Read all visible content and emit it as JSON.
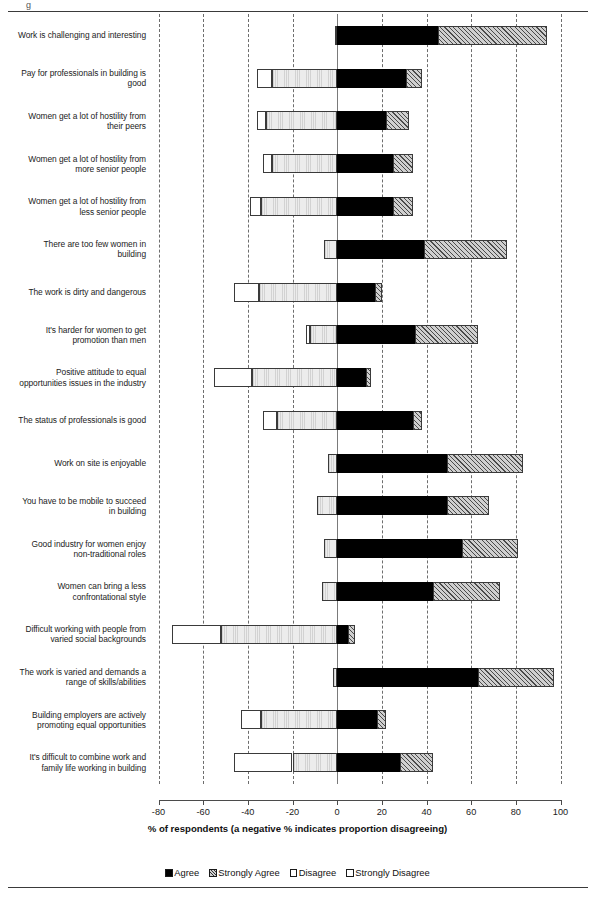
{
  "top_mark": "g",
  "chart_data": {
    "type": "bar",
    "subtype": "diverging-stacked-horizontal",
    "title": "",
    "xlabel": "% of respondents (a negative % indicates proportion disagreeing)",
    "ylabel": "",
    "xlim": [
      -80,
      100
    ],
    "xticks": [
      -80,
      -60,
      -40,
      -20,
      0,
      20,
      40,
      60,
      80,
      100
    ],
    "xticklabels": [
      "-80",
      "-60",
      "-40",
      "-20",
      "0",
      "20",
      "40",
      "60",
      "80",
      "100"
    ],
    "grid": "vertical-dashed",
    "legend_position": "bottom",
    "legend": [
      "Agree",
      "Strongly Agree",
      "Disagree",
      "Strongly Disagree"
    ],
    "series": [
      {
        "name": "Agree",
        "key": "agree",
        "fill": "solid-black"
      },
      {
        "name": "Strongly Agree",
        "key": "strongly_agree",
        "fill": "diagonal-hatch"
      },
      {
        "name": "Disagree",
        "key": "disagree",
        "fill": "light-stipple"
      },
      {
        "name": "Strongly Disagree",
        "key": "strongly_disagree",
        "fill": "white"
      }
    ],
    "categories": [
      "Work is challenging and interesting",
      "Pay for professionals in building is good",
      "Women get a lot of hostility from their peers",
      "Women get a lot of hostility from more senior people",
      "Women get a lot of hostility from less senior people",
      "There are too few women in building",
      "The work is dirty and dangerous",
      "It's harder for women to get promotion than men",
      "Positive attitude to equal opportunities issues in the industry",
      "The status of professionals is good",
      "Work on site is enjoyable",
      "You have to be mobile to succeed in building",
      "Good industry for women enjoy non-traditional roles",
      "Women can bring a less confrontational style",
      "Difficult working with people from varied social backgrounds",
      "The work is varied and demands a range of skills/abilities",
      "Building employers are actively promoting equal opportunities",
      "It's difficult to combine work and family life working in building"
    ],
    "rows": [
      {
        "label": "Work is challenging and interesting",
        "label_lines": [
          "Work is challenging and interesting"
        ],
        "agree": 45,
        "strongly_agree": 49,
        "disagree": -1,
        "strongly_disagree": 0
      },
      {
        "label": "Pay for professionals in building is good",
        "label_lines": [
          "Pay for professionals in building is",
          "good"
        ],
        "agree": 31,
        "strongly_agree": 7,
        "disagree": -29,
        "strongly_disagree": -7
      },
      {
        "label": "Women get a lot of hostility from their peers",
        "label_lines": [
          "Women get a lot of hostility from",
          "their peers"
        ],
        "agree": 22,
        "strongly_agree": 10,
        "disagree": -32,
        "strongly_disagree": -4
      },
      {
        "label": "Women get a lot of hostility from more senior people",
        "label_lines": [
          "Women get a lot of hostility from",
          "more senior people"
        ],
        "agree": 25,
        "strongly_agree": 9,
        "disagree": -29,
        "strongly_disagree": -4
      },
      {
        "label": "Women get a lot of hostility from less senior people",
        "label_lines": [
          "Women get a lot of hostility from",
          "less senior people"
        ],
        "agree": 25,
        "strongly_agree": 9,
        "disagree": -34,
        "strongly_disagree": -5
      },
      {
        "label": "There are too few women in building",
        "label_lines": [
          "There are too few women in",
          "building"
        ],
        "agree": 39,
        "strongly_agree": 37,
        "disagree": -6,
        "strongly_disagree": 0
      },
      {
        "label": "The work is dirty and dangerous",
        "label_lines": [
          "The work is dirty and dangerous"
        ],
        "agree": 17,
        "strongly_agree": 3,
        "disagree": -35,
        "strongly_disagree": -11
      },
      {
        "label": "It's harder for women to get promotion than men",
        "label_lines": [
          "It's harder for women to get",
          "promotion than men"
        ],
        "agree": 35,
        "strongly_agree": 28,
        "disagree": -12,
        "strongly_disagree": -2
      },
      {
        "label": "Positive attitude to equal opportunities issues in the industry",
        "label_lines": [
          "Positive attitude to equal",
          "opportunities issues in the industry"
        ],
        "agree": 13,
        "strongly_agree": 2,
        "disagree": -38,
        "strongly_disagree": -17
      },
      {
        "label": "The status of professionals is good",
        "label_lines": [
          "The status of professionals is good"
        ],
        "agree": 34,
        "strongly_agree": 4,
        "disagree": -27,
        "strongly_disagree": -6
      },
      {
        "label": "Work on site is enjoyable",
        "label_lines": [
          "Work on site is enjoyable"
        ],
        "agree": 49,
        "strongly_agree": 34,
        "disagree": -4,
        "strongly_disagree": 0
      },
      {
        "label": "You have to be mobile to succeed in building",
        "label_lines": [
          "You have to be mobile to succeed",
          "in building"
        ],
        "agree": 49,
        "strongly_agree": 19,
        "disagree": -9,
        "strongly_disagree": 0
      },
      {
        "label": "Good industry for women enjoy non-traditional roles",
        "label_lines": [
          "Good industry for women enjoy",
          "non-traditional roles"
        ],
        "agree": 56,
        "strongly_agree": 25,
        "disagree": -6,
        "strongly_disagree": 0
      },
      {
        "label": "Women can bring a less confrontational style",
        "label_lines": [
          "Women can bring a less",
          "confrontational style"
        ],
        "agree": 43,
        "strongly_agree": 30,
        "disagree": -7,
        "strongly_disagree": 0
      },
      {
        "label": "Difficult working with people from varied social backgrounds",
        "label_lines": [
          "Difficult working with people from",
          "varied social backgrounds"
        ],
        "agree": 5,
        "strongly_agree": 3,
        "disagree": -52,
        "strongly_disagree": -22
      },
      {
        "label": "The work is varied and demands a range of skills/abilities",
        "label_lines": [
          "The work is varied and demands a",
          "range of skills/abilities"
        ],
        "agree": 63,
        "strongly_agree": 34,
        "disagree": -2,
        "strongly_disagree": 0
      },
      {
        "label": "Building employers are actively promoting equal opportunities",
        "label_lines": [
          "Building employers are actively",
          "promoting equal opportunities"
        ],
        "agree": 18,
        "strongly_agree": 4,
        "disagree": -34,
        "strongly_disagree": -9
      },
      {
        "label": "It's difficult to combine work and family life working in building",
        "label_lines": [
          "It's difficult to combine work and",
          "family life working in building"
        ],
        "agree": 28,
        "strongly_agree": 15,
        "disagree": -20,
        "strongly_disagree": -26
      }
    ]
  }
}
